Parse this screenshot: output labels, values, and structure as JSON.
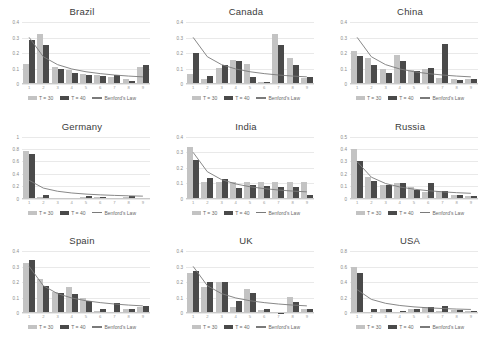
{
  "legend": {
    "t30_label": "T = 30",
    "t40_label": "T = 40",
    "benford_label": "Benford's Law",
    "t30_color": "#c3c3c3",
    "t40_color": "#4a4a4a",
    "benford_color": "#7a7a7a"
  },
  "chart_data": [
    {
      "type": "bar",
      "title": "Brazil",
      "categories": [
        "1",
        "2",
        "3",
        "4",
        "5",
        "6",
        "7",
        "8",
        "9"
      ],
      "xlabel": "",
      "ylabel": "",
      "ylim": [
        0,
        0.4
      ],
      "yticks": [
        0,
        0.1,
        0.2,
        0.3,
        0.4
      ],
      "ytick_labels": [
        "0",
        "0.1",
        "0.2",
        "0.3",
        "0.4"
      ],
      "grid": true,
      "legend_position": "bottom",
      "series": [
        {
          "name": "T = 30",
          "values": [
            0.128,
            0.322,
            0.112,
            0.09,
            0.067,
            0.055,
            0.048,
            0.03,
            0.108
          ]
        },
        {
          "name": "T = 40",
          "values": [
            0.283,
            0.253,
            0.097,
            0.068,
            0.06,
            0.052,
            0.055,
            0.022,
            0.122
          ]
        },
        {
          "name": "Benford's Law",
          "values": [
            0.301,
            0.176,
            0.125,
            0.097,
            0.079,
            0.067,
            0.058,
            0.051,
            0.046
          ]
        }
      ]
    },
    {
      "type": "bar",
      "title": "Canada",
      "categories": [
        "1",
        "2",
        "3",
        "4",
        "5",
        "6",
        "7",
        "8",
        "9"
      ],
      "xlabel": "",
      "ylabel": "",
      "ylim": [
        0,
        0.4
      ],
      "yticks": [
        0,
        0.1,
        0.2,
        0.3,
        0.4
      ],
      "ytick_labels": [
        "0",
        "0.1",
        "0.2",
        "0.3",
        "0.4"
      ],
      "grid": true,
      "legend_position": "bottom",
      "series": [
        {
          "name": "T = 30",
          "values": [
            0.066,
            0.035,
            0.101,
            0.155,
            0.13,
            0.012,
            0.325,
            0.165,
            0.042
          ]
        },
        {
          "name": "T = 40",
          "values": [
            0.203,
            0.05,
            0.122,
            0.148,
            0.048,
            0.01,
            0.252,
            0.125,
            0.048
          ]
        },
        {
          "name": "Benford's Law",
          "values": [
            0.301,
            0.176,
            0.125,
            0.097,
            0.079,
            0.067,
            0.058,
            0.051,
            0.046
          ]
        }
      ]
    },
    {
      "type": "bar",
      "title": "China",
      "categories": [
        "1",
        "2",
        "3",
        "4",
        "5",
        "6",
        "7",
        "8",
        "9"
      ],
      "xlabel": "",
      "ylabel": "",
      "ylim": [
        0,
        0.4
      ],
      "yticks": [
        0,
        0.1,
        0.2,
        0.3,
        0.4
      ],
      "ytick_labels": [
        "0",
        "0.1",
        "0.2",
        "0.3",
        "0.4"
      ],
      "grid": true,
      "legend_position": "bottom",
      "series": [
        {
          "name": "T = 30",
          "values": [
            0.215,
            0.165,
            0.1,
            0.19,
            0.092,
            0.1,
            0.04,
            0.03,
            0.03
          ]
        },
        {
          "name": "T = 40",
          "values": [
            0.18,
            0.12,
            0.072,
            0.15,
            0.082,
            0.105,
            0.255,
            0.028,
            0.03
          ]
        },
        {
          "name": "Benford's Law",
          "values": [
            0.301,
            0.176,
            0.125,
            0.097,
            0.079,
            0.067,
            0.058,
            0.051,
            0.046
          ]
        }
      ]
    },
    {
      "type": "bar",
      "title": "Germany",
      "categories": [
        "1",
        "2",
        "3",
        "4",
        "5",
        "6",
        "7",
        "8",
        "9"
      ],
      "xlabel": "",
      "ylabel": "",
      "ylim": [
        0,
        1
      ],
      "yticks": [
        0,
        0.2,
        0.4,
        0.6,
        0.8,
        1
      ],
      "ytick_labels": [
        "0",
        "0.2",
        "0.4",
        "0.6",
        "0.8",
        "1"
      ],
      "grid": true,
      "legend_position": "bottom",
      "series": [
        {
          "name": "T = 30",
          "values": [
            0.77,
            0.03,
            0.01,
            0.012,
            0.03,
            0.018,
            0.012,
            0.028,
            0.012
          ]
        },
        {
          "name": "T = 40",
          "values": [
            0.725,
            0.052,
            0.008,
            0.01,
            0.038,
            0.02,
            0.01,
            0.035,
            0.01
          ]
        },
        {
          "name": "Benford's Law",
          "values": [
            0.301,
            0.176,
            0.125,
            0.097,
            0.079,
            0.067,
            0.058,
            0.051,
            0.046
          ]
        }
      ]
    },
    {
      "type": "bar",
      "title": "India",
      "categories": [
        "1",
        "2",
        "3",
        "4",
        "5",
        "6",
        "7",
        "8",
        "9"
      ],
      "xlabel": "",
      "ylabel": "",
      "ylim": [
        0,
        0.4
      ],
      "yticks": [
        0,
        0.1,
        0.2,
        0.3,
        0.4
      ],
      "ytick_labels": [
        "0",
        "0.1",
        "0.2",
        "0.3",
        "0.4"
      ],
      "grid": true,
      "legend_position": "bottom",
      "series": [
        {
          "name": "T = 30",
          "values": [
            0.33,
            0.105,
            0.105,
            0.105,
            0.105,
            0.105,
            0.105,
            0.105,
            0.105
          ]
        },
        {
          "name": "T = 40",
          "values": [
            0.25,
            0.135,
            0.128,
            0.068,
            0.085,
            0.082,
            0.072,
            0.078,
            0.025
          ]
        },
        {
          "name": "Benford's Law",
          "values": [
            0.301,
            0.176,
            0.125,
            0.097,
            0.079,
            0.067,
            0.058,
            0.051,
            0.046
          ]
        }
      ]
    },
    {
      "type": "bar",
      "title": "Russia",
      "categories": [
        "1",
        "2",
        "3",
        "4",
        "5",
        "6",
        "7",
        "8",
        "9"
      ],
      "xlabel": "",
      "ylabel": "",
      "ylim": [
        0,
        0.5
      ],
      "yticks": [
        0,
        0.1,
        0.2,
        0.3,
        0.4,
        0.5
      ],
      "ytick_labels": [
        "0",
        "0.1",
        "0.2",
        "0.3",
        "0.4",
        "0.5"
      ],
      "grid": true,
      "legend_position": "bottom",
      "series": [
        {
          "name": "T = 30",
          "values": [
            0.4,
            0.175,
            0.108,
            0.128,
            0.095,
            0.052,
            0.06,
            0.03,
            0.025
          ]
        },
        {
          "name": "T = 40",
          "values": [
            0.3,
            0.145,
            0.112,
            0.122,
            0.072,
            0.122,
            0.058,
            0.028,
            0.022
          ]
        },
        {
          "name": "Benford's Law",
          "values": [
            0.301,
            0.176,
            0.125,
            0.097,
            0.079,
            0.067,
            0.058,
            0.051,
            0.046
          ]
        }
      ]
    },
    {
      "type": "bar",
      "title": "Spain",
      "categories": [
        "1",
        "2",
        "3",
        "4",
        "5",
        "6",
        "7",
        "8",
        "9"
      ],
      "xlabel": "",
      "ylabel": "",
      "ylim": [
        0,
        0.4
      ],
      "yticks": [
        0,
        0.1,
        0.2,
        0.3,
        0.4
      ],
      "ytick_labels": [
        "0",
        "0.1",
        "0.2",
        "0.3",
        "0.4"
      ],
      "grid": true,
      "legend_position": "bottom",
      "series": [
        {
          "name": "T = 30",
          "values": [
            0.325,
            0.222,
            0.135,
            0.168,
            0.098,
            0.012,
            0.01,
            0.03,
            0.04
          ]
        },
        {
          "name": "T = 40",
          "values": [
            0.345,
            0.175,
            0.128,
            0.122,
            0.078,
            0.028,
            0.065,
            0.028,
            0.048
          ]
        },
        {
          "name": "Benford's Law",
          "values": [
            0.301,
            0.176,
            0.125,
            0.097,
            0.079,
            0.067,
            0.058,
            0.051,
            0.046
          ]
        }
      ]
    },
    {
      "type": "bar",
      "title": "UK",
      "categories": [
        "1",
        "2",
        "3",
        "4",
        "5",
        "6",
        "7",
        "8",
        "9"
      ],
      "xlabel": "",
      "ylabel": "",
      "ylim": [
        0,
        0.4
      ],
      "yticks": [
        0,
        0.1,
        0.2,
        0.3,
        0.4
      ],
      "ytick_labels": [
        "0",
        "0.1",
        "0.2",
        "0.3",
        "0.4"
      ],
      "grid": true,
      "legend_position": "bottom",
      "series": [
        {
          "name": "T = 30",
          "values": [
            0.262,
            0.172,
            0.202,
            0.04,
            0.158,
            0.022,
            0.005,
            0.102,
            0.028
          ]
        },
        {
          "name": "T = 40",
          "values": [
            0.275,
            0.202,
            0.202,
            0.08,
            0.13,
            0.028,
            0.004,
            0.075,
            0.025
          ]
        },
        {
          "name": "Benford's Law",
          "values": [
            0.301,
            0.176,
            0.125,
            0.097,
            0.079,
            0.067,
            0.058,
            0.051,
            0.046
          ]
        }
      ]
    },
    {
      "type": "bar",
      "title": "USA",
      "categories": [
        "1",
        "2",
        "3",
        "4",
        "5",
        "6",
        "7",
        "8",
        "9"
      ],
      "xlabel": "",
      "ylabel": "",
      "ylim": [
        0,
        0.8
      ],
      "yticks": [
        0,
        0.2,
        0.4,
        0.6,
        0.8
      ],
      "ytick_labels": [
        "0",
        "0.2",
        "0.4",
        "0.6",
        "0.8"
      ],
      "grid": true,
      "legend_position": "bottom",
      "series": [
        {
          "name": "T = 30",
          "values": [
            0.595,
            0.012,
            0.048,
            0.01,
            0.06,
            0.08,
            0.03,
            0.035,
            0.022
          ]
        },
        {
          "name": "T = 40",
          "values": [
            0.52,
            0.05,
            0.048,
            0.022,
            0.048,
            0.082,
            0.095,
            0.04,
            0.022
          ]
        },
        {
          "name": "Benford's Law",
          "values": [
            0.301,
            0.176,
            0.125,
            0.097,
            0.079,
            0.067,
            0.058,
            0.051,
            0.046
          ]
        }
      ]
    }
  ]
}
